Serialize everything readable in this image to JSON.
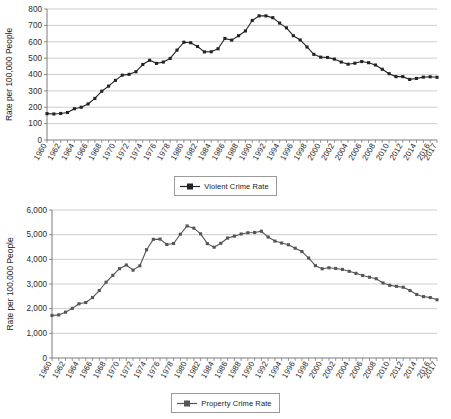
{
  "figure": {
    "background": "#ffffff",
    "grid_color": "#b9b9b9",
    "axis_color": "#6e6e6e",
    "tick_label_color": "#2b2b2b"
  },
  "charts": [
    {
      "id": "violent-crime-rate",
      "ylabel": "Rate per 100,000 People",
      "legend_label": "Violent Crime Rate",
      "series_color": "#232323",
      "yticks": [
        "0",
        "100",
        "200",
        "300",
        "400",
        "500",
        "600",
        "700",
        "800"
      ],
      "xticks": [
        "1960",
        "1962",
        "1964",
        "1966",
        "1968",
        "1970",
        "1972",
        "1974",
        "1976",
        "1978",
        "1980",
        "1982",
        "1984",
        "1986",
        "1988",
        "1990",
        "1992",
        "1994",
        "1996",
        "1998",
        "2000",
        "2002",
        "2004",
        "2006",
        "2008",
        "2010",
        "2012",
        "2014",
        "2016",
        "2017"
      ]
    },
    {
      "id": "property-crime-rate",
      "ylabel": "Rate per 100,000 People",
      "legend_label": "Property Crime Rate",
      "series_color": "#555555",
      "yticks": [
        "0",
        "1,000",
        "2,000",
        "3,000",
        "4,000",
        "5,000",
        "6,000"
      ],
      "xticks": [
        "1960",
        "1962",
        "1964",
        "1966",
        "1968",
        "1970",
        "1972",
        "1974",
        "1976",
        "1978",
        "1980",
        "1982",
        "1984",
        "1986",
        "1988",
        "1990",
        "1992",
        "1994",
        "1996",
        "1998",
        "2000",
        "2002",
        "2004",
        "2006",
        "2008",
        "2010",
        "2012",
        "2014",
        "2016",
        "2017"
      ]
    }
  ],
  "chart_data": [
    {
      "type": "line",
      "title": "",
      "xlabel": "",
      "ylabel": "Rate per 100,000 People",
      "legend": [
        "Violent Crime Rate"
      ],
      "legend_position": "bottom-center",
      "grid": true,
      "ylim": [
        0,
        800
      ],
      "ytick_step": 100,
      "x": [
        1960,
        1961,
        1962,
        1963,
        1964,
        1965,
        1966,
        1967,
        1968,
        1969,
        1970,
        1971,
        1972,
        1973,
        1974,
        1975,
        1976,
        1977,
        1978,
        1979,
        1980,
        1981,
        1982,
        1983,
        1984,
        1985,
        1986,
        1987,
        1988,
        1989,
        1990,
        1991,
        1992,
        1993,
        1994,
        1995,
        1996,
        1997,
        1998,
        1999,
        2000,
        2001,
        2002,
        2003,
        2004,
        2005,
        2006,
        2007,
        2008,
        2009,
        2010,
        2011,
        2012,
        2013,
        2014,
        2015,
        2016,
        2017
      ],
      "series": [
        {
          "name": "Violent Crime Rate",
          "color": "#232323",
          "values": [
            161,
            159,
            162,
            168,
            191,
            200,
            220,
            254,
            298,
            329,
            364,
            396,
            401,
            417,
            461,
            487,
            468,
            476,
            498,
            549,
            597,
            594,
            571,
            538,
            539,
            557,
            620,
            610,
            637,
            666,
            730,
            758,
            758,
            747,
            714,
            685,
            637,
            611,
            568,
            523,
            506,
            504,
            494,
            476,
            463,
            469,
            479,
            472,
            458,
            432,
            405,
            387,
            387,
            370,
            376,
            384,
            386,
            383
          ]
        }
      ]
    },
    {
      "type": "line",
      "title": "",
      "xlabel": "",
      "ylabel": "Rate per 100,000 People",
      "legend": [
        "Property Crime Rate"
      ],
      "legend_position": "bottom-center",
      "grid": true,
      "ylim": [
        0,
        6000
      ],
      "ytick_step": 1000,
      "x": [
        1960,
        1961,
        1962,
        1963,
        1964,
        1965,
        1966,
        1967,
        1968,
        1969,
        1970,
        1971,
        1972,
        1973,
        1974,
        1975,
        1976,
        1977,
        1978,
        1979,
        1980,
        1981,
        1982,
        1983,
        1984,
        1985,
        1986,
        1987,
        1988,
        1989,
        1990,
        1991,
        1992,
        1993,
        1994,
        1995,
        1996,
        1997,
        1998,
        1999,
        2000,
        2001,
        2002,
        2003,
        2004,
        2005,
        2006,
        2007,
        2008,
        2009,
        2010,
        2011,
        2012,
        2013,
        2014,
        2015,
        2016,
        2017
      ],
      "series": [
        {
          "name": "Property Crime Rate",
          "color": "#555555",
          "values": [
            1726,
            1747,
            1858,
            2012,
            2198,
            2249,
            2450,
            2736,
            3071,
            3351,
            3621,
            3769,
            3561,
            3737,
            4389,
            4811,
            4820,
            4602,
            4643,
            5017,
            5353,
            5264,
            5033,
            4637,
            4492,
            4651,
            4863,
            4940,
            5027,
            5078,
            5088,
            5140,
            4903,
            4740,
            4660,
            4591,
            4451,
            4316,
            4052,
            3744,
            3618,
            3658,
            3631,
            3591,
            3514,
            3432,
            3347,
            3276,
            3215,
            3041,
            2946,
            2905,
            2868,
            2734,
            2574,
            2487,
            2451,
            2362
          ]
        }
      ]
    }
  ]
}
